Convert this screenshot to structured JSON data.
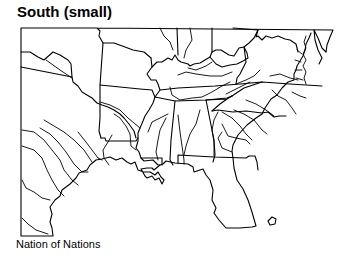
{
  "map": {
    "title": "South (small)",
    "caption": "Nation of Nations",
    "region": "Southern United States",
    "style": "black outline map with state borders and rivers",
    "colors": {
      "line": "#000000",
      "background": "#ffffff"
    }
  }
}
